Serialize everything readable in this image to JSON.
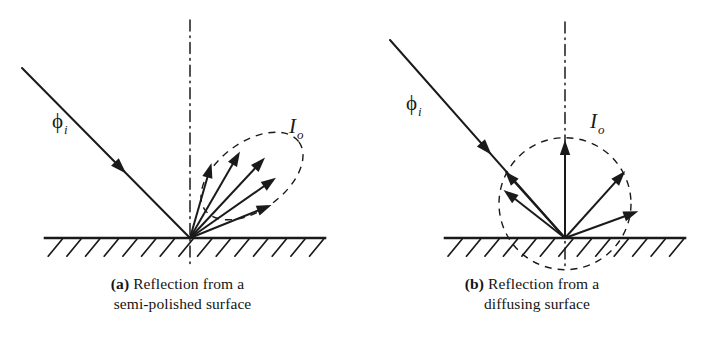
{
  "figure": {
    "type": "optics-reflection-diagram",
    "background": "#ffffff",
    "ink": "#1a1a1a",
    "width": 709,
    "height": 352
  },
  "panels": [
    {
      "key": "a",
      "lead": "(a)",
      "caption_line1": "Reflection from a",
      "caption_line2": "semi-polished surface",
      "surface_label": "semi-polished surface",
      "incident_label": "ϕ",
      "incident_sub": "i",
      "intensity_label": "I",
      "intensity_sub": "o",
      "normal_style": "dash-dot",
      "lobe_style": "dashed",
      "lobe_shape": "narrow specular lobe",
      "origin": {
        "x": 190,
        "y": 238
      },
      "surface": {
        "x1": 45,
        "x2": 325,
        "y": 238
      },
      "normal": {
        "x": 190,
        "y_top": 20,
        "y_bottom": 266
      },
      "incident_ray": {
        "x1": 22,
        "y1": 68,
        "x2": 190,
        "y2": 238,
        "arrow_t": 0.62
      },
      "ray_angles_deg": [
        22,
        35,
        47,
        60,
        74
      ],
      "ray_lengths": [
        88,
        105,
        110,
        100,
        78
      ],
      "label_phi": {
        "x": 52,
        "y": 128
      },
      "label_io": {
        "x": 289,
        "y": 133
      }
    },
    {
      "key": "b",
      "lead": "(b)",
      "caption_line1": "Reflection from a",
      "caption_line2": "diffusing surface",
      "surface_label": "diffusing surface",
      "incident_label": "ϕ",
      "incident_sub": "i",
      "intensity_label": "I",
      "intensity_sub": "o",
      "normal_style": "dash-dot",
      "lobe_style": "dashed",
      "lobe_shape": "circular diffuse envelope",
      "origin": {
        "x": 565,
        "y": 238
      },
      "surface": {
        "x1": 445,
        "x2": 685,
        "y": 238
      },
      "normal": {
        "x": 565,
        "y_top": 22,
        "y_bottom": 266
      },
      "incident_ray": {
        "x1": 390,
        "y1": 40,
        "x2": 565,
        "y2": 238,
        "arrow_t": 0.58
      },
      "ray_angles_deg": [
        20,
        48,
        90,
        132,
        142
      ],
      "ray_lengths": [
        78,
        90,
        98,
        90,
        78
      ],
      "circle_radius": 66,
      "label_phi": {
        "x": 406,
        "y": 110
      },
      "label_io": {
        "x": 590,
        "y": 128
      }
    }
  ],
  "hatching": {
    "style": "diagonal up-right",
    "count_a": 15,
    "count_b": 13
  }
}
